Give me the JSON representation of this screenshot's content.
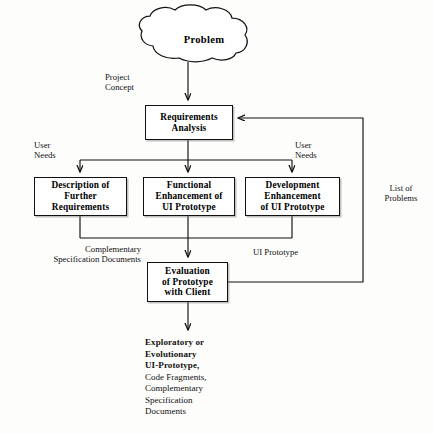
{
  "diagram": {
    "colors": {
      "stroke": "#111111",
      "fill": "#ffffff",
      "background": "#fdfdfb"
    },
    "nodes": {
      "problem": {
        "label": "Problem",
        "shape": "cloud"
      },
      "requirements_analysis": {
        "line1": "Requirements",
        "line2": "Analysis",
        "shape": "box"
      },
      "description_further_requirements": {
        "line1": "Description of",
        "line2": "Further",
        "line3": "Requirements",
        "shape": "box"
      },
      "functional_enhancement": {
        "line1": "Functional",
        "line2": "Enhancement of",
        "line3": "UI Prototype",
        "shape": "box"
      },
      "development_enhancement": {
        "line1": "Development",
        "line2": "Enhancement",
        "line3": "of UI Prototype",
        "shape": "box"
      },
      "evaluation": {
        "line1": "Evaluation",
        "line2": "of Prototype",
        "line3": "with Client",
        "shape": "box"
      }
    },
    "edge_labels": {
      "project_concept": "Project\nConcept",
      "user_needs_left": "User\nNeeds",
      "user_needs_right": "User\nNeeds",
      "complementary_specification_documents": "Complementary\nSpecification Documents",
      "ui_prototype": "UI Prototype",
      "list_of_problems": "List of\nProblems"
    },
    "output": {
      "bold_lines": [
        "Exploratory or",
        "Evolutionary",
        "UI-Prototype,"
      ],
      "plain_lines": [
        "Code Fragments,",
        "Complementary",
        "Specification",
        "Documents"
      ]
    }
  }
}
